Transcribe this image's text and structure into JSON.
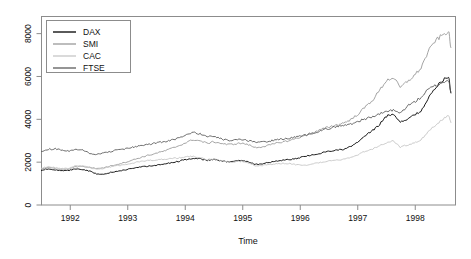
{
  "chart_data": {
    "type": "line",
    "title": "",
    "xlabel": "Time",
    "ylabel": "",
    "xlim": [
      1991.5,
      1998.7
    ],
    "ylim": [
      0,
      8800
    ],
    "grid": false,
    "legend_position": "top-left",
    "xticks": [
      1992,
      1993,
      1994,
      1995,
      1996,
      1997,
      1998
    ],
    "xtick_labels": [
      "1992",
      "1993",
      "1994",
      "1995",
      "1996",
      "1997",
      "1998"
    ],
    "yticks": [
      0,
      2000,
      4000,
      6000,
      8000
    ],
    "ytick_labels": [
      "0",
      "2000",
      "4000",
      "6000",
      "8000"
    ],
    "series": [
      {
        "name": "DAX",
        "color": "#000000",
        "x": [
          1991.5,
          1991.62,
          1991.74,
          1991.86,
          1991.98,
          1992.1,
          1992.22,
          1992.34,
          1992.46,
          1992.58,
          1992.7,
          1992.82,
          1992.94,
          1993.06,
          1993.18,
          1993.3,
          1993.42,
          1993.54,
          1993.66,
          1993.78,
          1993.9,
          1994.02,
          1994.14,
          1994.26,
          1994.38,
          1994.5,
          1994.62,
          1994.74,
          1994.86,
          1994.98,
          1995.1,
          1995.22,
          1995.34,
          1995.46,
          1995.58,
          1995.7,
          1995.82,
          1995.94,
          1996.06,
          1996.18,
          1996.3,
          1996.42,
          1996.54,
          1996.66,
          1996.78,
          1996.9,
          1997.02,
          1997.14,
          1997.26,
          1997.38,
          1997.5,
          1997.62,
          1997.74,
          1997.86,
          1997.98,
          1998.1,
          1998.22,
          1998.34,
          1998.46,
          1998.58,
          1998.62
        ],
        "values": [
          1620,
          1700,
          1640,
          1590,
          1610,
          1690,
          1660,
          1580,
          1450,
          1420,
          1520,
          1580,
          1640,
          1690,
          1760,
          1800,
          1830,
          1870,
          1920,
          1990,
          2050,
          2130,
          2180,
          2150,
          2080,
          2120,
          2060,
          2010,
          2050,
          2090,
          2020,
          1890,
          1930,
          1980,
          2050,
          2100,
          2120,
          2180,
          2250,
          2320,
          2380,
          2470,
          2530,
          2560,
          2620,
          2750,
          2980,
          3250,
          3480,
          3760,
          4150,
          4260,
          3880,
          4020,
          4180,
          4400,
          4950,
          5400,
          5800,
          6010,
          5230
        ]
      },
      {
        "name": "SMI",
        "color": "#9a9a9a",
        "x": [
          1991.5,
          1991.62,
          1991.74,
          1991.86,
          1991.98,
          1992.1,
          1992.22,
          1992.34,
          1992.46,
          1992.58,
          1992.7,
          1992.82,
          1992.94,
          1993.06,
          1993.18,
          1993.3,
          1993.42,
          1993.54,
          1993.66,
          1993.78,
          1993.9,
          1994.02,
          1994.14,
          1994.26,
          1994.38,
          1994.5,
          1994.62,
          1994.74,
          1994.86,
          1994.98,
          1995.1,
          1995.22,
          1995.34,
          1995.46,
          1995.58,
          1995.7,
          1995.82,
          1995.94,
          1996.06,
          1996.18,
          1996.3,
          1996.42,
          1996.54,
          1996.66,
          1996.78,
          1996.9,
          1997.02,
          1997.14,
          1997.26,
          1997.38,
          1997.5,
          1997.62,
          1997.74,
          1997.86,
          1997.98,
          1998.1,
          1998.22,
          1998.34,
          1998.46,
          1998.58,
          1998.62
        ],
        "values": [
          1680,
          1740,
          1700,
          1660,
          1680,
          1790,
          1800,
          1760,
          1700,
          1740,
          1820,
          1900,
          1980,
          2080,
          2180,
          2280,
          2360,
          2450,
          2540,
          2660,
          2780,
          2920,
          3050,
          2990,
          2880,
          2950,
          2880,
          2820,
          2850,
          2890,
          2810,
          2680,
          2720,
          2790,
          2880,
          2950,
          3010,
          3120,
          3220,
          3340,
          3450,
          3580,
          3680,
          3750,
          3860,
          4020,
          4280,
          4600,
          4900,
          5350,
          5820,
          5950,
          5480,
          5760,
          6030,
          6400,
          7120,
          7650,
          7900,
          8120,
          7350
        ]
      },
      {
        "name": "CAC",
        "color": "#c6c6c6",
        "x": [
          1991.5,
          1991.62,
          1991.74,
          1991.86,
          1991.98,
          1992.1,
          1992.22,
          1992.34,
          1992.46,
          1992.58,
          1992.7,
          1992.82,
          1992.94,
          1993.06,
          1993.18,
          1993.3,
          1993.42,
          1993.54,
          1993.66,
          1993.78,
          1993.9,
          1994.02,
          1994.14,
          1994.26,
          1994.38,
          1994.5,
          1994.62,
          1994.74,
          1994.86,
          1994.98,
          1995.1,
          1995.22,
          1995.34,
          1995.46,
          1995.58,
          1995.7,
          1995.82,
          1995.94,
          1996.06,
          1996.18,
          1996.3,
          1996.42,
          1996.54,
          1996.66,
          1996.78,
          1996.9,
          1997.02,
          1997.14,
          1997.26,
          1997.38,
          1997.5,
          1997.62,
          1997.74,
          1997.86,
          1997.98,
          1998.1,
          1998.22,
          1998.34,
          1998.46,
          1998.58,
          1998.62
        ],
        "values": [
          1720,
          1790,
          1740,
          1700,
          1720,
          1830,
          1810,
          1740,
          1680,
          1700,
          1780,
          1830,
          1880,
          1940,
          2010,
          2060,
          2090,
          2120,
          2150,
          2180,
          2200,
          2250,
          2260,
          2200,
          2120,
          2150,
          2080,
          2010,
          2020,
          2040,
          1960,
          1830,
          1850,
          1880,
          1920,
          1950,
          1930,
          1880,
          1840,
          1900,
          1960,
          2030,
          2070,
          2100,
          2160,
          2240,
          2380,
          2520,
          2620,
          2760,
          2920,
          2980,
          2700,
          2800,
          2900,
          3050,
          3400,
          3700,
          3950,
          4200,
          3850
        ]
      },
      {
        "name": "FTSE",
        "color": "#5c5c5c",
        "x": [
          1991.5,
          1991.62,
          1991.74,
          1991.86,
          1991.98,
          1992.1,
          1992.22,
          1992.34,
          1992.46,
          1992.58,
          1992.7,
          1992.82,
          1992.94,
          1993.06,
          1993.18,
          1993.3,
          1993.42,
          1993.54,
          1993.66,
          1993.78,
          1993.9,
          1994.02,
          1994.14,
          1994.26,
          1994.38,
          1994.5,
          1994.62,
          1994.74,
          1994.86,
          1994.98,
          1995.1,
          1995.22,
          1995.34,
          1995.46,
          1995.58,
          1995.7,
          1995.82,
          1995.94,
          1996.06,
          1996.18,
          1996.3,
          1996.42,
          1996.54,
          1996.66,
          1996.78,
          1996.9,
          1997.02,
          1997.14,
          1997.26,
          1997.38,
          1997.5,
          1997.62,
          1997.74,
          1997.86,
          1997.98,
          1998.1,
          1998.22,
          1998.34,
          1998.46,
          1998.58,
          1998.62
        ],
        "values": [
          2480,
          2600,
          2620,
          2560,
          2500,
          2580,
          2560,
          2420,
          2360,
          2420,
          2500,
          2580,
          2620,
          2680,
          2740,
          2800,
          2860,
          2920,
          2980,
          3050,
          3120,
          3260,
          3400,
          3320,
          3200,
          3180,
          3090,
          3010,
          3030,
          3060,
          2990,
          2930,
          2950,
          2980,
          3040,
          3080,
          3120,
          3190,
          3250,
          3340,
          3420,
          3520,
          3600,
          3680,
          3720,
          3800,
          3920,
          4030,
          4120,
          4240,
          4380,
          4420,
          4280,
          4620,
          4800,
          5020,
          5380,
          5560,
          5700,
          5820,
          5280
        ]
      }
    ]
  },
  "legend": {
    "items": [
      {
        "label": "DAX",
        "color": "#000000"
      },
      {
        "label": "SMI",
        "color": "#9a9a9a"
      },
      {
        "label": "CAC",
        "color": "#c6c6c6"
      },
      {
        "label": "FTSE",
        "color": "#5c5c5c"
      }
    ]
  },
  "axes": {
    "x_axis_title": "Time",
    "frame_color": "#8c8c8c"
  }
}
